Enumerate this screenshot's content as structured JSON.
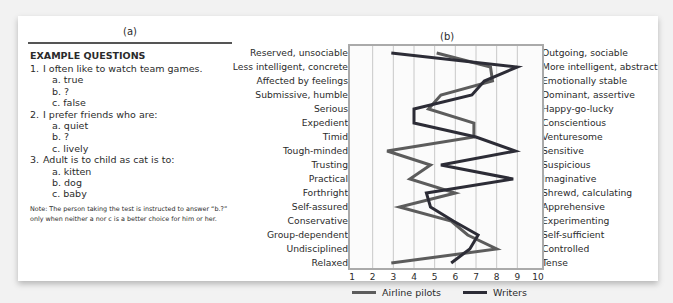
{
  "panel_a": {
    "title": "(a)",
    "heading": "EXAMPLE QUESTIONS",
    "questions": [
      {
        "num": "1.",
        "text": "I often like to watch team games.",
        "options": [
          "a. true",
          "b. ?",
          "c. false"
        ]
      },
      {
        "num": "2.",
        "text": "I prefer friends who are:",
        "options": [
          "a. quiet",
          "b. ?",
          "c. lively"
        ]
      },
      {
        "num": "3.",
        "text": "Adult is to child as cat is to:",
        "options": [
          "a. kitten",
          "b. dog",
          "c. baby"
        ]
      }
    ],
    "note": "Note: The person taking the test is instructed to answer “b.?” only when neither a nor c is a better choice for him or her."
  },
  "panel_b": {
    "title": "(b)"
  },
  "chart_data": {
    "type": "line",
    "orientation": "horizontal-profile",
    "title": "(b)",
    "xlabel": "",
    "ylabel": "",
    "xlim": [
      1,
      10
    ],
    "x_ticks": [
      "1",
      "2",
      "3",
      "4",
      "5",
      "6",
      "7",
      "8",
      "9",
      "10"
    ],
    "grid": "vertical",
    "legend_position": "bottom",
    "left_traits": [
      "Reserved, unsociable",
      "Less intelligent, concrete",
      "Affected by feelings",
      "Submissive, humble",
      "Serious",
      "Expedient",
      "Timid",
      "Tough-minded",
      "Trusting",
      "Practical",
      "Forthright",
      "Self-assured",
      "Conservative",
      "Group-dependent",
      "Undisciplined",
      "Relaxed"
    ],
    "right_traits": [
      "Outgoing, sociable",
      "More intelligent, abstract",
      "Emotionally stable",
      "Dominant, assertive",
      "Happy-go-lucky",
      "Conscientious",
      "Venturesome",
      "Sensitive",
      "Suspicious",
      "Imaginative",
      "Shrewd, calculating",
      "Apprehensive",
      "Experimenting",
      "Self-sufficient",
      "Controlled",
      "Tense"
    ],
    "series": [
      {
        "name": "Airline pilots",
        "color": "#5c5c5c",
        "values": [
          5.1,
          7.7,
          7.8,
          5.3,
          4.7,
          6.9,
          6.9,
          2.7,
          4.8,
          3.8,
          6.0,
          3.3,
          5.8,
          6.6,
          8.0,
          2.9
        ]
      },
      {
        "name": "Writers",
        "color": "#2c2c36",
        "values": [
          2.9,
          9.0,
          7.4,
          6.8,
          4.0,
          4.0,
          7.0,
          8.9,
          5.3,
          8.8,
          4.6,
          4.8,
          5.9,
          7.1,
          6.7,
          5.8
        ]
      }
    ]
  },
  "legend": {
    "pilots_label": "Airline pilots",
    "writers_label": "Writers"
  }
}
